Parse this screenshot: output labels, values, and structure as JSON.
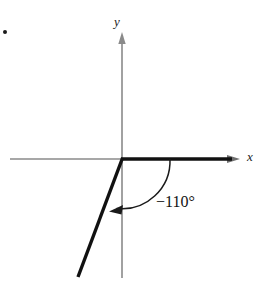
{
  "figure": {
    "kind": "coordinate-plane-angle-diagram",
    "width": 277,
    "height": 291,
    "background": "#ffffff",
    "bullet_marker": "•",
    "axis_color": "#8a8a8a",
    "ray_color": "#111111",
    "arc_color": "#1a1a1a",
    "label_color": "#1a1a1a"
  },
  "axes": {
    "x_label": "x",
    "y_label": "y",
    "origin": {
      "x": 122,
      "y": 159
    },
    "x_axis": {
      "x_start": 10,
      "x_end": 240,
      "y": 159,
      "arrow": "right"
    },
    "y_axis": {
      "y_start": 33,
      "y_end": 278,
      "x": 122,
      "arrow": "up"
    }
  },
  "angle": {
    "label": "−110°",
    "degrees": -110,
    "sign": "negative",
    "direction": "clockwise",
    "initial_side": {
      "from": {
        "x": 122,
        "y": 159
      },
      "to": {
        "x": 237,
        "y": 159
      },
      "description": "positive x-axis"
    },
    "terminal_side": {
      "from": {
        "x": 122,
        "y": 159
      },
      "to": {
        "x": 78,
        "y": 277
      },
      "quadrant": 3
    },
    "arc": {
      "start": {
        "x": 170,
        "y": 159
      },
      "end": {
        "x": 113,
        "y": 211
      },
      "radius": 50,
      "arrowhead": "end"
    }
  }
}
